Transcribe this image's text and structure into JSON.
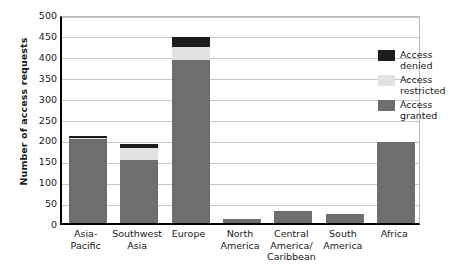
{
  "chart_data": {
    "type": "bar",
    "stacked": true,
    "title": "",
    "xlabel": "",
    "ylabel": "Number of access requests",
    "ylim": [
      0,
      500
    ],
    "ytick_step": 50,
    "yticks": [
      0,
      50,
      100,
      150,
      200,
      250,
      300,
      350,
      400,
      450,
      500
    ],
    "grid": true,
    "legend_position": "upper right inside plot",
    "categories": [
      "Asia-\nPacific",
      "Southwest\nAsia",
      "Europe",
      "North\nAmerica",
      "Central\nAmerica/\nCaribbean",
      "South\nAmerica",
      "Africa"
    ],
    "category_lines": [
      [
        "Asia-",
        "Pacific"
      ],
      [
        "Southwest",
        "Asia"
      ],
      [
        "Europe"
      ],
      [
        "North",
        "America"
      ],
      [
        "Central",
        "America/",
        "Caribbean"
      ],
      [
        "South",
        "America"
      ],
      [
        "Africa"
      ]
    ],
    "series": [
      {
        "name": "Access granted",
        "color": "#6e6e6e",
        "values": [
          200,
          150,
          390,
          9,
          28,
          22,
          193
        ]
      },
      {
        "name": "Access restricted",
        "color": "#e2e2e2",
        "values": [
          3,
          30,
          30,
          0,
          0,
          0,
          0
        ]
      },
      {
        "name": "Access denied",
        "color": "#1c1c1c",
        "values": [
          6,
          10,
          25,
          0,
          0,
          0,
          0
        ]
      }
    ],
    "totals": [
      209,
      190,
      445,
      9,
      28,
      22,
      193
    ]
  },
  "legend": {
    "entries": [
      {
        "label_lines": [
          "Access",
          "denied"
        ],
        "key": "denied"
      },
      {
        "label_lines": [
          "Access",
          "restricted"
        ],
        "key": "restricted"
      },
      {
        "label_lines": [
          "Access",
          "granted"
        ],
        "key": "granted"
      }
    ]
  }
}
